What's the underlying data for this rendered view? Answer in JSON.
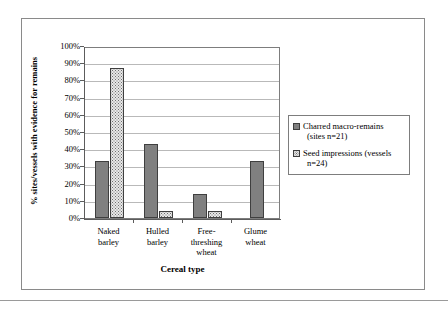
{
  "chart_data": {
    "type": "bar",
    "title": "",
    "subtitle": "",
    "xlabel": "Cereal type",
    "ylabel": "% sites/vessels with evidence for remains",
    "categories": [
      "Naked barley",
      "Hulled barley",
      "Free-threshing wheat",
      "Glume wheat"
    ],
    "category_lines": [
      [
        "Naked",
        "barley"
      ],
      [
        "Hulled",
        "barley"
      ],
      [
        "Free-",
        "threshing",
        "wheat"
      ],
      [
        "Glume",
        "wheat"
      ]
    ],
    "series": [
      {
        "name": "Charred macro-remains (sites n=21)",
        "name_line1": "Charred macro-remains",
        "name_line2": "(sites n=21)",
        "values": [
          33,
          43,
          14,
          33
        ],
        "color": "#808080",
        "pattern": "solid"
      },
      {
        "name": "Seed impressions (vessels n=24)",
        "name_line1": "Seed impressions (vessels",
        "name_line2": "n=24)",
        "values": [
          87,
          4,
          4,
          0
        ],
        "color": "#e8e8e8",
        "pattern": "dotted"
      }
    ],
    "ylim": [
      0,
      100
    ],
    "ytick_values": [
      0,
      10,
      20,
      30,
      40,
      50,
      60,
      70,
      80,
      90,
      100
    ],
    "ytick_labels": [
      "0%",
      "10%",
      "20%",
      "30%",
      "40%",
      "50%",
      "60%",
      "70%",
      "80%",
      "90%",
      "100%"
    ],
    "grid": true,
    "grid_axis": "y",
    "legend_position": "right",
    "legend_entries": [
      "Charred macro-remains (sites n=21)",
      "Seed impressions (vessels n=24)"
    ]
  }
}
